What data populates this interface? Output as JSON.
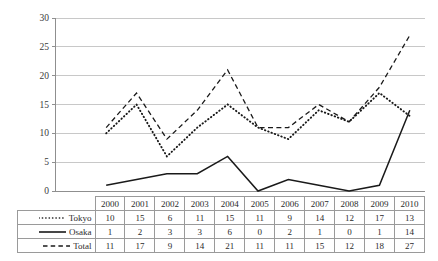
{
  "chart_data": {
    "type": "line",
    "title": "",
    "subtitle": "",
    "xlabel": "",
    "ylabel": "",
    "categories": [
      "2000",
      "2001",
      "2002",
      "2003",
      "2004",
      "2005",
      "2006",
      "2007",
      "2008",
      "2009",
      "2010"
    ],
    "series": [
      {
        "name": "Tokyo",
        "style": "dotted",
        "color": "#1a1a1a",
        "values": [
          10,
          15,
          6,
          11,
          15,
          11,
          9,
          14,
          12,
          17,
          13
        ]
      },
      {
        "name": "Osaka",
        "style": "solid",
        "color": "#1a1a1a",
        "values": [
          1,
          2,
          3,
          3,
          6,
          0,
          2,
          1,
          0,
          1,
          14
        ]
      },
      {
        "name": "Total",
        "style": "dashed",
        "color": "#1a1a1a",
        "values": [
          11,
          17,
          9,
          14,
          21,
          11,
          11,
          15,
          12,
          18,
          27
        ]
      }
    ],
    "ylim": [
      0,
      30
    ],
    "yticks": [
      0,
      5,
      10,
      15,
      20,
      25,
      30
    ],
    "ytick_labels": [
      "0",
      "5",
      "10",
      "15",
      "20",
      "25",
      "30"
    ],
    "grid": "horizontal",
    "legend_position": "table-row-labels",
    "markers": false
  },
  "table": {
    "header_corner": "",
    "columns": [
      "2000",
      "2001",
      "2002",
      "2003",
      "2004",
      "2005",
      "2006",
      "2007",
      "2008",
      "2009",
      "2010"
    ],
    "rows": [
      {
        "label": "Tokyo",
        "marker": "dotted",
        "values": [
          "10",
          "15",
          "6",
          "11",
          "15",
          "11",
          "9",
          "14",
          "12",
          "17",
          "13"
        ]
      },
      {
        "label": "Osaka",
        "marker": "solid",
        "values": [
          "1",
          "2",
          "3",
          "3",
          "6",
          "0",
          "2",
          "1",
          "0",
          "1",
          "14"
        ]
      },
      {
        "label": "Total",
        "marker": "dashed",
        "values": [
          "11",
          "17",
          "9",
          "14",
          "21",
          "11",
          "11",
          "15",
          "12",
          "18",
          "27"
        ]
      }
    ]
  },
  "colors": {
    "gridline": "#c8c8c8",
    "axis": "#8f8f8f",
    "data_line": "#1a1a1a",
    "table_border": "#9a9a9a",
    "text": "#2b2b2b",
    "background": "#ffffff"
  }
}
